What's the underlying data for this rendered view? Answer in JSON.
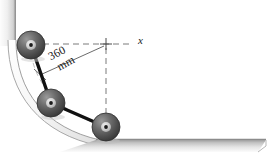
{
  "figure": {
    "background_color": "#ffffff",
    "width": 271,
    "height": 161
  },
  "axes": {
    "x_label": "x",
    "origin_marker": "cross-tick",
    "horizontal_dashed_line": true,
    "vertical_dashed_line": true,
    "dash_color": "#7a7a7a"
  },
  "dimension": {
    "value": "360",
    "unit": "mm",
    "full_label": "360 mm",
    "leader_line": true,
    "tick_mark": true
  },
  "geometry": {
    "wall_color": "#b9b9b9",
    "ground_color": "#b5b5b5",
    "track_color": "#cfcfcf",
    "link_color": "#111111",
    "roller_fill_dark": "#4f4f4f",
    "roller_fill_light": "#8e8e8e",
    "roller_hub_color": "#dcdcdc",
    "roller_center_dot": "#1b1b1b"
  },
  "rollers": [
    {
      "name": "roller-top",
      "cx": 31,
      "cy": 45,
      "r": 14
    },
    {
      "name": "roller-middle",
      "cx": 51,
      "cy": 103,
      "r": 14
    },
    {
      "name": "roller-bottom",
      "cx": 106,
      "cy": 127,
      "r": 14
    }
  ],
  "links": [
    {
      "name": "link-upper",
      "from": "roller-top",
      "to": "roller-middle"
    },
    {
      "name": "link-lower",
      "from": "roller-middle",
      "to": "roller-bottom"
    }
  ]
}
